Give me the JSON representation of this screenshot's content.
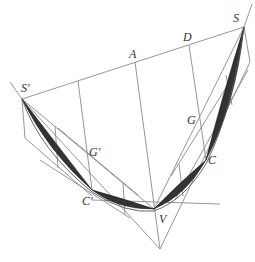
{
  "figure": {
    "type": "geometric diagram",
    "labels": {
      "S_prime": "S′",
      "S": "S",
      "A": "A",
      "D": "D",
      "G": "G",
      "G_prime": "G′",
      "C": "C",
      "C_prime": "C′",
      "V": "V"
    },
    "colors": {
      "lines": "#8a8a8a",
      "shaded_segments": "#333333",
      "labels": "#333333",
      "background": "#ffffff"
    }
  }
}
